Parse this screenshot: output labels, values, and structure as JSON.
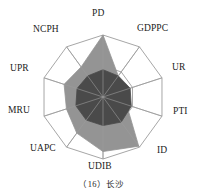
{
  "caption": "（16）长沙",
  "colors": {
    "grid": "#9c9c9c",
    "spoke": "#9c9c9c",
    "series_outer_fill": "#949494",
    "series_inner_fill": "#4a4a4a",
    "label_text": "#1b1b1b",
    "background": "#ffffff"
  },
  "axes": [
    {
      "key": "PD",
      "label": "PD",
      "angle_deg": 0,
      "label_x": 92,
      "label_y": 9
    },
    {
      "key": "GDPPC",
      "label": "GDPPC",
      "angle_deg": 36,
      "label_x": 137,
      "label_y": 24
    },
    {
      "key": "UR",
      "label": "UR",
      "angle_deg": 72,
      "label_x": 172,
      "label_y": 63
    },
    {
      "key": "PTI",
      "label": "PTI",
      "angle_deg": 108,
      "label_x": 173,
      "label_y": 107
    },
    {
      "key": "ID",
      "label": "ID",
      "angle_deg": 144,
      "label_x": 157,
      "label_y": 146
    },
    {
      "key": "UDIB",
      "label": "UDIB",
      "angle_deg": 180,
      "label_x": 88,
      "label_y": 162
    },
    {
      "key": "UAPC",
      "label": "UAPC",
      "angle_deg": 216,
      "label_x": 30,
      "label_y": 144
    },
    {
      "key": "MRU",
      "label": "MRU",
      "angle_deg": 252,
      "label_x": 8,
      "label_y": 106
    },
    {
      "key": "UPR",
      "label": "UPR",
      "angle_deg": 288,
      "label_x": 10,
      "label_y": 64
    },
    {
      "key": "NCPH",
      "label": "NCPH",
      "angle_deg": 324,
      "label_x": 33,
      "label_y": 25
    }
  ],
  "chart_data": {
    "type": "radar",
    "title": "（16）长沙",
    "categories": [
      "PD",
      "GDPPC",
      "UR",
      "PTI",
      "ID",
      "UDIB",
      "UAPC",
      "MRU",
      "UPR",
      "NCPH"
    ],
    "rlim": [
      0,
      1
    ],
    "grid": true,
    "grid_rings": [
      0.5,
      1.0
    ],
    "legend": "none",
    "series": [
      {
        "name": "outer",
        "color": "#949494",
        "values": [
          1.0,
          0.42,
          0.38,
          0.4,
          0.98,
          0.88,
          0.72,
          0.62,
          0.66,
          0.6
        ]
      },
      {
        "name": "inner",
        "color": "#4a4a4a",
        "values": [
          0.44,
          0.42,
          0.46,
          0.48,
          0.5,
          0.46,
          0.46,
          0.46,
          0.44,
          0.42
        ]
      }
    ]
  },
  "geometry": {
    "center_x": 103,
    "center_y": 97,
    "radius": 62
  }
}
